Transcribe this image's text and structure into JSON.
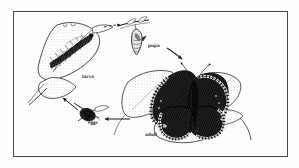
{
  "figure": {
    "kind": "butterfly-life-cycle-diagram",
    "style": "black-and-white scanned line drawing",
    "background_color": "#fdfdfd",
    "ink_color": "#1a1a1a",
    "border": {
      "name": "figure-frame",
      "color": "#4a4a4a",
      "x": 13,
      "y": 11,
      "width": 275,
      "height": 146,
      "stroke_width": 1
    },
    "stages": [
      {
        "id": "larva",
        "label": "larva",
        "description": "caterpillar feeding on a leaf",
        "label_x": 82,
        "label_y": 75
      },
      {
        "id": "pupa",
        "label": "pupa",
        "description": "chrysalis hanging from a twig",
        "label_x": 148,
        "label_y": 44
      },
      {
        "id": "adult",
        "label": "adult",
        "description": "dark butterfly with pale spotted wing margins resting on leaves",
        "label_x": 145,
        "label_y": 133
      },
      {
        "id": "eggs",
        "label": "eggs",
        "description": "cluster of eggs on a stem",
        "label_x": 88,
        "label_y": 121
      }
    ],
    "arrows": [
      {
        "id": "larva-to-pupa",
        "from": "larva",
        "to": "pupa",
        "style": "dashed",
        "direction": "right"
      },
      {
        "id": "pupa-to-adult",
        "from": "pupa",
        "to": "adult",
        "style": "solid",
        "direction": "down-right"
      },
      {
        "id": "adult-to-eggs",
        "from": "adult",
        "to": "eggs",
        "style": "solid",
        "direction": "left"
      },
      {
        "id": "eggs-to-larva",
        "from": "eggs",
        "to": "larva",
        "style": "solid",
        "direction": "up-left"
      }
    ]
  }
}
